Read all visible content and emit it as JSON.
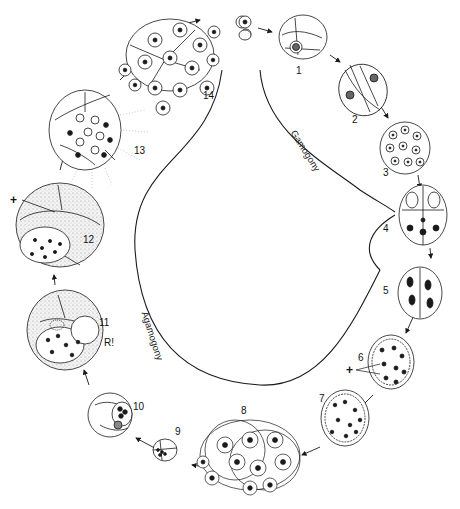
{
  "diagram": {
    "title": "",
    "phases": {
      "gamogony": "Gamogony",
      "agamogony": "Agamogony"
    },
    "stages": [
      {
        "id": 1,
        "label": "1"
      },
      {
        "id": 2,
        "label": "2"
      },
      {
        "id": 3,
        "label": "3"
      },
      {
        "id": 4,
        "label": "4"
      },
      {
        "id": 5,
        "label": "5"
      },
      {
        "id": 6,
        "label": "6"
      },
      {
        "id": 7,
        "label": "7"
      },
      {
        "id": 8,
        "label": "8"
      },
      {
        "id": 9,
        "label": "9"
      },
      {
        "id": 10,
        "label": "10"
      },
      {
        "id": 11,
        "label": "11"
      },
      {
        "id": 12,
        "label": "12"
      },
      {
        "id": 13,
        "label": "13"
      },
      {
        "id": 14,
        "label": "14"
      }
    ],
    "annotations": {
      "plus_stage12": "+",
      "plus_stage6": "+",
      "reduction_mark": "R!"
    },
    "colors": {
      "ink": "#1a1a1a",
      "stipple": "#d8d8d8",
      "background": "#ffffff"
    }
  }
}
